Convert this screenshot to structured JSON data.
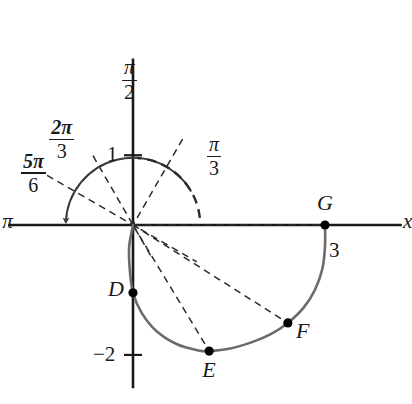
{
  "figure": {
    "type": "polar-graph",
    "colors": {
      "axis": "#1a1a1a",
      "curve": "#6b6b6b",
      "dashed": "#1a1a1a",
      "point": "#000000",
      "background": "#ffffff"
    }
  },
  "axes": {
    "x_axis_label": "x",
    "x_axis_left_label": "π",
    "y_axis_top_label": {
      "numerator": "π",
      "denominator": "2"
    },
    "y_tick_positive_label": "1",
    "y_tick_negative_label": "−2",
    "x_tick_label": "3",
    "origin_px": [
      133,
      225
    ],
    "unit_px": 64,
    "x_range_units": [
      -1.95,
      4.2
    ],
    "y_range_units": [
      -2.55,
      2.6
    ]
  },
  "angle_rays": [
    {
      "id": "pi-over-3",
      "label": {
        "numerator": "π",
        "denominator": "3"
      },
      "angle_deg": 60,
      "style": "dashed"
    },
    {
      "id": "2pi-over-3",
      "label": {
        "numerator": "2π",
        "denominator": "3"
      },
      "angle_deg": 120,
      "style": "dashed"
    },
    {
      "id": "5pi-over-6",
      "label": {
        "numerator": "5π",
        "denominator": "6"
      },
      "angle_deg": 150,
      "style": "dashed"
    }
  ],
  "points": [
    {
      "id": "D",
      "label": "D",
      "x_units": 0.0,
      "y_units": -1.06,
      "label_side": "left"
    },
    {
      "id": "E",
      "label": "E",
      "x_units": 1.19,
      "y_units": -1.97,
      "label_side": "below"
    },
    {
      "id": "F",
      "label": "F",
      "x_units": 2.42,
      "y_units": -1.53,
      "label_side": "right"
    },
    {
      "id": "G",
      "label": "G",
      "x_units": 3.0,
      "y_units": 0.0,
      "label_side": "above"
    }
  ],
  "arcs": {
    "sweep_arc": {
      "style": "solid",
      "radius_units": 1.05,
      "from_deg": 30,
      "to_deg": 178,
      "arrowhead": true
    },
    "dashed_arc": {
      "style": "dashed",
      "radius_units": 1.05,
      "from_deg": 6,
      "to_deg": 86
    }
  },
  "curve": {
    "name": "limacon",
    "style": "solid",
    "stroke": "#6b6b6b",
    "path_units": [
      [
        0.0,
        0.0
      ],
      [
        -0.06,
        -0.34
      ],
      [
        -0.05,
        -0.7
      ],
      [
        0.0,
        -1.06
      ],
      [
        0.14,
        -1.38
      ],
      [
        0.37,
        -1.66
      ],
      [
        0.68,
        -1.86
      ],
      [
        1.02,
        -1.96
      ],
      [
        1.19,
        -1.97
      ],
      [
        1.52,
        -1.93
      ],
      [
        1.86,
        -1.83
      ],
      [
        2.16,
        -1.7
      ],
      [
        2.42,
        -1.53
      ],
      [
        2.66,
        -1.3
      ],
      [
        2.84,
        -1.02
      ],
      [
        2.96,
        -0.68
      ],
      [
        3.0,
        -0.33
      ],
      [
        3.0,
        0.0
      ]
    ]
  }
}
